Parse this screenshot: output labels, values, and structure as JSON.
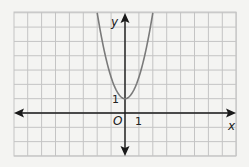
{
  "chart_data": {
    "type": "line",
    "title": "",
    "function": "y = 1.5x^2 + 1",
    "xlabel": "x",
    "ylabel": "y",
    "origin_label": "O",
    "tick_labels": {
      "x": [
        "1"
      ],
      "y": [
        "1"
      ]
    },
    "xlim": [
      -8,
      8
    ],
    "ylim": [
      -3,
      7
    ],
    "grid": true,
    "vertex": [
      0,
      1
    ],
    "series": [
      {
        "name": "parabola",
        "x": [
          -2,
          -1.5,
          -1,
          -0.5,
          0,
          0.5,
          1,
          1.5,
          2
        ],
        "y": [
          7,
          4.4,
          2.5,
          1.4,
          1,
          1.4,
          2.5,
          4.4,
          7
        ]
      }
    ],
    "colors": {
      "curve": "#7a7a7a",
      "axis": "#1a1a1a",
      "grid": "#c4c4c4",
      "background": "#f4f4f2"
    }
  }
}
